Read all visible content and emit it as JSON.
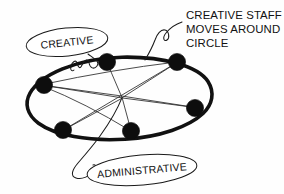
{
  "diagram": {
    "style": "hand-drawn sketch",
    "background_color": "#fefefe",
    "ink_color": "#111111",
    "title_visible": false
  },
  "callout": {
    "name": "creative-staff-note",
    "lines": [
      "CREATIVE STAFF",
      "MOVES AROUND",
      "CIRCLE"
    ],
    "line1": "CREATIVE STAFF",
    "line2": "MOVES AROUND",
    "line3": "CIRCLE"
  },
  "bubbles": [
    {
      "name": "creative-bubble",
      "label": "CREATIVE",
      "cx": 67,
      "cy": 42,
      "rx": 41,
      "ry": 14,
      "rotation": -6
    },
    {
      "name": "administrative-bubble",
      "label": "ADMINISTRATIVE",
      "cx": 142,
      "cy": 170,
      "rx": 55,
      "ry": 15,
      "rotation": -5
    }
  ],
  "labels": {
    "creative": "CREATIVE",
    "administrative": "ADMINISTRATIVE"
  },
  "ring": {
    "name": "staff-circle",
    "cx": 122,
    "cy": 97,
    "rx": 88,
    "ry": 40,
    "rotation": -7,
    "stroke_width": 3.6,
    "stroke_color": "#111111"
  },
  "hub": {
    "name": "center-hub",
    "x": 122,
    "y": 98
  },
  "nodes": [
    {
      "name": "node-left",
      "x": 44,
      "y": 85,
      "r": 8.6
    },
    {
      "name": "node-top-left",
      "x": 107,
      "y": 62,
      "r": 8.6
    },
    {
      "name": "node-top-right",
      "x": 177,
      "y": 62,
      "r": 8.6
    },
    {
      "name": "node-right",
      "x": 195,
      "y": 108,
      "r": 8.6
    },
    {
      "name": "node-bottom-right",
      "x": 131,
      "y": 131,
      "r": 8.6
    },
    {
      "name": "node-bottom-left",
      "x": 63,
      "y": 130,
      "r": 8.6
    }
  ],
  "spokes": [
    {
      "name": "spoke-left",
      "from": "node-left",
      "to": "center-hub"
    },
    {
      "name": "spoke-top-left",
      "from": "node-top-left",
      "to": "center-hub"
    },
    {
      "name": "spoke-top-right",
      "from": "node-top-right",
      "to": "center-hub"
    },
    {
      "name": "spoke-right",
      "from": "node-right",
      "to": "center-hub"
    },
    {
      "name": "spoke-bottom-right",
      "from": "node-bottom-right",
      "to": "center-hub"
    },
    {
      "name": "spoke-bottom-left",
      "from": "node-bottom-left",
      "to": "center-hub"
    }
  ],
  "chords": [
    {
      "name": "chord-left-to-right",
      "from": "node-left",
      "to": "node-right"
    },
    {
      "name": "chord-bottomleft-to-topright",
      "from": "node-bottom-left",
      "to": "node-top-right"
    }
  ],
  "leaders": [
    {
      "name": "creative-leader",
      "from": "creative-bubble",
      "to": "ring-upper-left-arc"
    },
    {
      "name": "creative-staff-leader",
      "from": "creative-staff-note",
      "to": "ring-top-arc"
    },
    {
      "name": "administrative-leader",
      "from": "administrative-bubble",
      "to": "center-hub"
    }
  ]
}
